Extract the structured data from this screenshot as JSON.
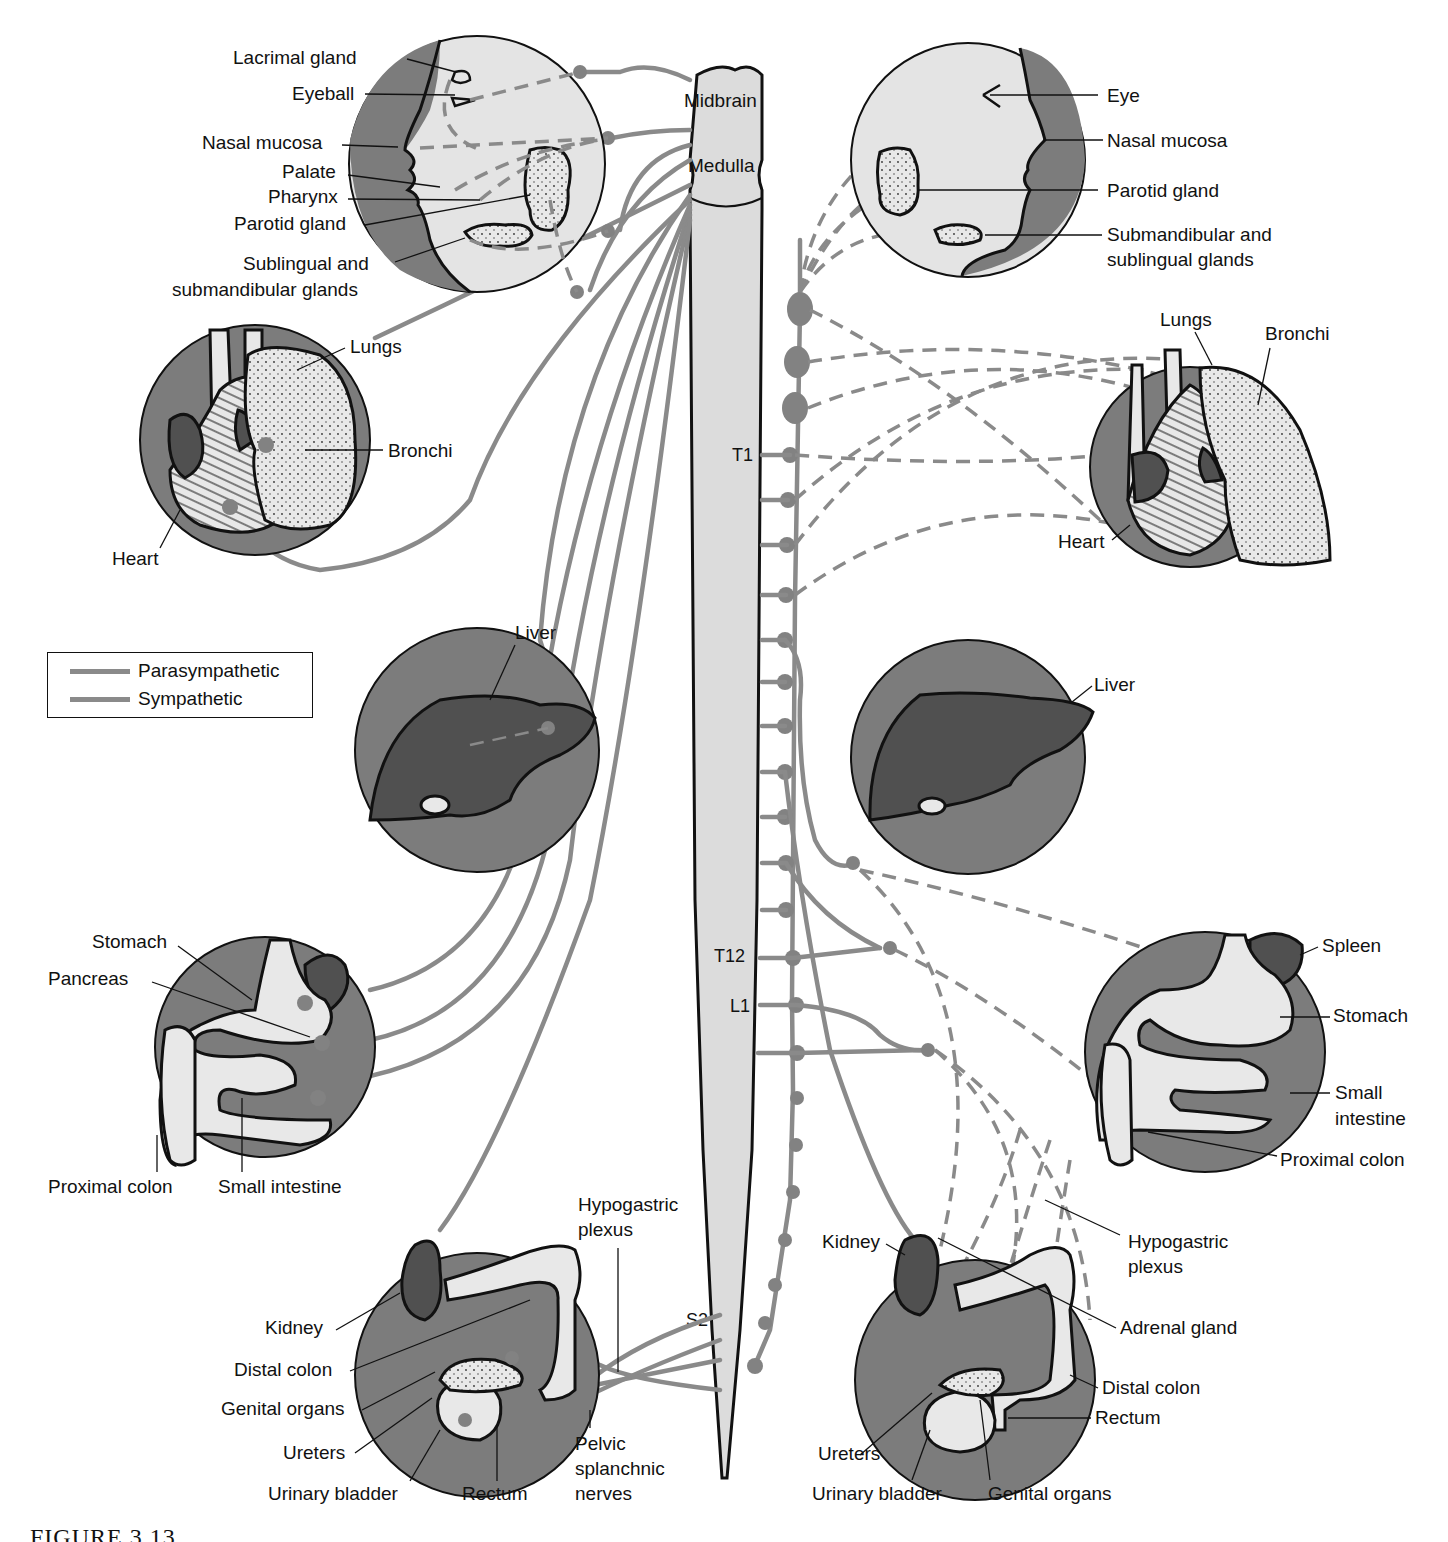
{
  "figure": {
    "caption": "FIGURE 3.13",
    "legend": {
      "items": [
        {
          "label": "Parasympathetic",
          "color": "#8a8a8a",
          "style": "solid"
        },
        {
          "label": "Sympathetic",
          "color": "#8a8a8a",
          "style": "dashed"
        }
      ]
    },
    "cns": {
      "midbrain": "Midbrain",
      "medulla": "Medulla",
      "segments": {
        "t1": "T1",
        "t12": "T12",
        "l1": "L1",
        "s2": "S2"
      }
    },
    "left_parasympathetic": {
      "head": {
        "lacrimal_gland": "Lacrimal gland",
        "eyeball": "Eyeball",
        "nasal_mucosa": "Nasal mucosa",
        "palate": "Palate",
        "pharynx": "Pharynx",
        "parotid_gland": "Parotid gland",
        "sublingual_line1": "Sublingual and",
        "sublingual_line2": "submandibular glands"
      },
      "thorax": {
        "lungs": "Lungs",
        "bronchi": "Bronchi",
        "heart": "Heart"
      },
      "liver": {
        "liver": "Liver"
      },
      "abdomen": {
        "stomach": "Stomach",
        "pancreas": "Pancreas",
        "proximal_colon": "Proximal colon",
        "small_intestine": "Small intestine"
      },
      "pelvis": {
        "hypogastric_line1": "Hypogastric",
        "hypogastric_line2": "plexus",
        "kidney": "Kidney",
        "distal_colon": "Distal colon",
        "genital_organs": "Genital organs",
        "ureters": "Ureters",
        "urinary_bladder": "Urinary  bladder",
        "rectum": "Rectum",
        "pelvic_line1": "Pelvic",
        "pelvic_line2": "splanchnic",
        "pelvic_line3": "nerves"
      }
    },
    "right_sympathetic": {
      "head": {
        "eye": "Eye",
        "nasal_mucosa": "Nasal mucosa",
        "parotid_gland": "Parotid gland",
        "submandibular_line1": "Submandibular and",
        "submandibular_line2": "sublingual glands"
      },
      "thorax": {
        "lungs": "Lungs",
        "bronchi": "Bronchi",
        "heart": "Heart"
      },
      "liver": {
        "liver": "Liver"
      },
      "abdomen": {
        "spleen": "Spleen",
        "stomach": "Stomach",
        "small_line1": "Small",
        "small_line2": "intestine",
        "proximal_colon": "Proximal colon"
      },
      "pelvis": {
        "kidney": "Kidney",
        "hypogastric_line1": "Hypogastric",
        "hypogastric_line2": "plexus",
        "adrenal_gland": "Adrenal gland",
        "distal_colon": "Distal colon",
        "rectum": "Rectum",
        "ureters": "Ureters",
        "urinary_bladder": "Urinary bladder",
        "genital_organs": "Genital organs"
      }
    },
    "colors": {
      "nerve": "#8a8a8a",
      "disc_dark": "#7c7c7c",
      "disc_light": "#e4e4e4",
      "organ_dark": "#505050",
      "cord_fill": "#dcdcdc"
    }
  }
}
